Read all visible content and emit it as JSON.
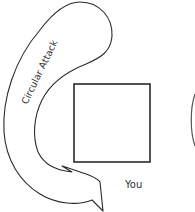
{
  "diagram": {
    "arrow_label": "Circular Attack",
    "box_label": "You",
    "colors": {
      "stroke": "#2a2a2a",
      "text": "#333333",
      "background": "#ffffff"
    }
  }
}
